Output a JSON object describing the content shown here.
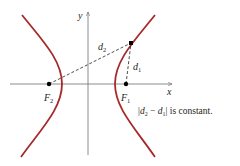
{
  "figure": {
    "axes": {
      "x_label": "x",
      "y_label": "y",
      "color": "#6d6e71"
    },
    "curve": {
      "name": "hyperbola",
      "color": "#a52a2a"
    },
    "foci": {
      "f1": {
        "main": "F",
        "sub": "1"
      },
      "f2": {
        "main": "F",
        "sub": "2"
      }
    },
    "distances": {
      "d1": {
        "main": "d",
        "sub": "1"
      },
      "d2": {
        "main": "d",
        "sub": "2"
      }
    },
    "caption": {
      "bar_left": "|",
      "d2_main": "d",
      "d2_sub": "2",
      "minus": " − ",
      "d1_main": "d",
      "d1_sub": "1",
      "bar_right": "|",
      "rest": " is constant."
    }
  }
}
